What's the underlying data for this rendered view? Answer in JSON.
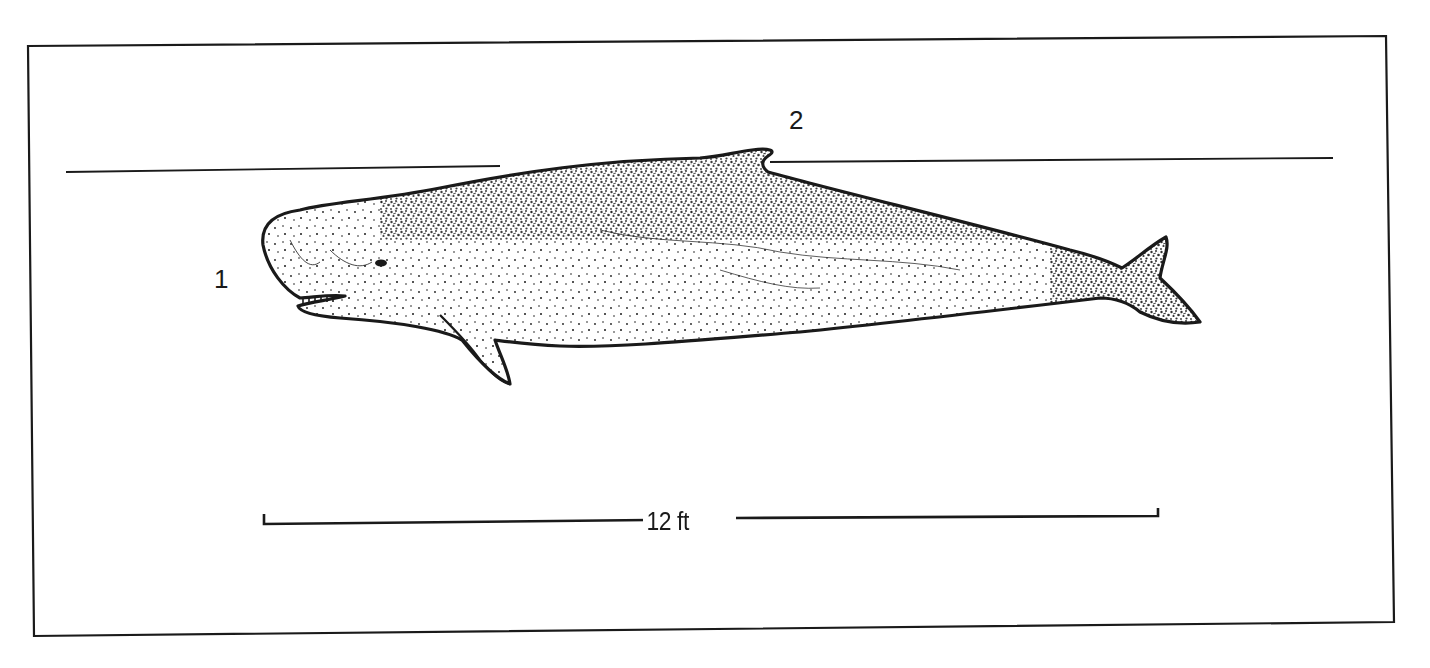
{
  "figure": {
    "colors": {
      "ink": "#1a1a1a",
      "background": "#ffffff"
    },
    "labels": [
      {
        "id": "1",
        "text": "1",
        "points_to": "blunt square head"
      },
      {
        "id": "2",
        "text": "2",
        "points_to": "low rounded dorsal hump"
      }
    ],
    "waterline": {
      "visible": true
    },
    "scale_bar": {
      "label": "12 ft"
    }
  }
}
